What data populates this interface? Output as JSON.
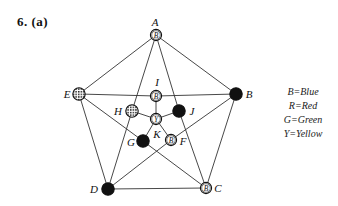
{
  "problem": {
    "label": "6.   (a)"
  },
  "colors": {
    "ink": "#111111",
    "background": "#ffffff"
  },
  "graph": {
    "nodes": [
      {
        "id": "A",
        "label": "A",
        "color_code": "B",
        "style": "letter",
        "x": 156,
        "y": 35,
        "lx": 155,
        "ly": 26
      },
      {
        "id": "B",
        "label": "B",
        "color_code": "G",
        "style": "solid",
        "x": 236,
        "y": 94,
        "lx": 249,
        "ly": 98
      },
      {
        "id": "C",
        "label": "C",
        "color_code": "B",
        "style": "letter",
        "x": 206,
        "y": 188,
        "lx": 218,
        "ly": 192
      },
      {
        "id": "D",
        "label": "D",
        "color_code": "G",
        "style": "solid",
        "x": 108,
        "y": 189,
        "lx": 94,
        "ly": 193
      },
      {
        "id": "E",
        "label": "E",
        "color_code": "R",
        "style": "hatched",
        "x": 79,
        "y": 94,
        "lx": 67,
        "ly": 98
      },
      {
        "id": "I",
        "label": "I",
        "color_code": "B",
        "style": "letter",
        "x": 156,
        "y": 96,
        "lx": 157,
        "ly": 86
      },
      {
        "id": "H",
        "label": "H",
        "color_code": "R",
        "style": "hatched",
        "x": 132,
        "y": 111,
        "lx": 118,
        "ly": 115
      },
      {
        "id": "J",
        "label": "J",
        "color_code": "G",
        "style": "solid",
        "x": 179,
        "y": 111,
        "lx": 192,
        "ly": 115
      },
      {
        "id": "G",
        "label": "G",
        "color_code": "G",
        "style": "solid",
        "x": 143,
        "y": 141,
        "lx": 131,
        "ly": 146
      },
      {
        "id": "F",
        "label": "F",
        "color_code": "B",
        "style": "letter",
        "x": 171,
        "y": 140,
        "lx": 183,
        "ly": 145
      },
      {
        "id": "K",
        "label": "K",
        "color_code": "Y",
        "style": "letter",
        "x": 156,
        "y": 119,
        "lx": 157,
        "ly": 138
      }
    ],
    "edges": [
      [
        "A",
        "B"
      ],
      [
        "B",
        "C"
      ],
      [
        "C",
        "D"
      ],
      [
        "D",
        "E"
      ],
      [
        "E",
        "A"
      ],
      [
        "A",
        "H"
      ],
      [
        "H",
        "D"
      ],
      [
        "A",
        "J"
      ],
      [
        "J",
        "C"
      ],
      [
        "E",
        "I"
      ],
      [
        "I",
        "B"
      ],
      [
        "E",
        "G"
      ],
      [
        "G",
        "C"
      ],
      [
        "D",
        "F"
      ],
      [
        "F",
        "B"
      ],
      [
        "K",
        "I"
      ],
      [
        "K",
        "H"
      ],
      [
        "K",
        "J"
      ],
      [
        "K",
        "G"
      ],
      [
        "K",
        "F"
      ]
    ]
  },
  "legend": {
    "items": [
      {
        "code": "B",
        "text": "B=Blue"
      },
      {
        "code": "R",
        "text": "R=Red"
      },
      {
        "code": "G",
        "text": "G=Green"
      },
      {
        "code": "Y",
        "text": "Y=Yellow"
      }
    ]
  }
}
